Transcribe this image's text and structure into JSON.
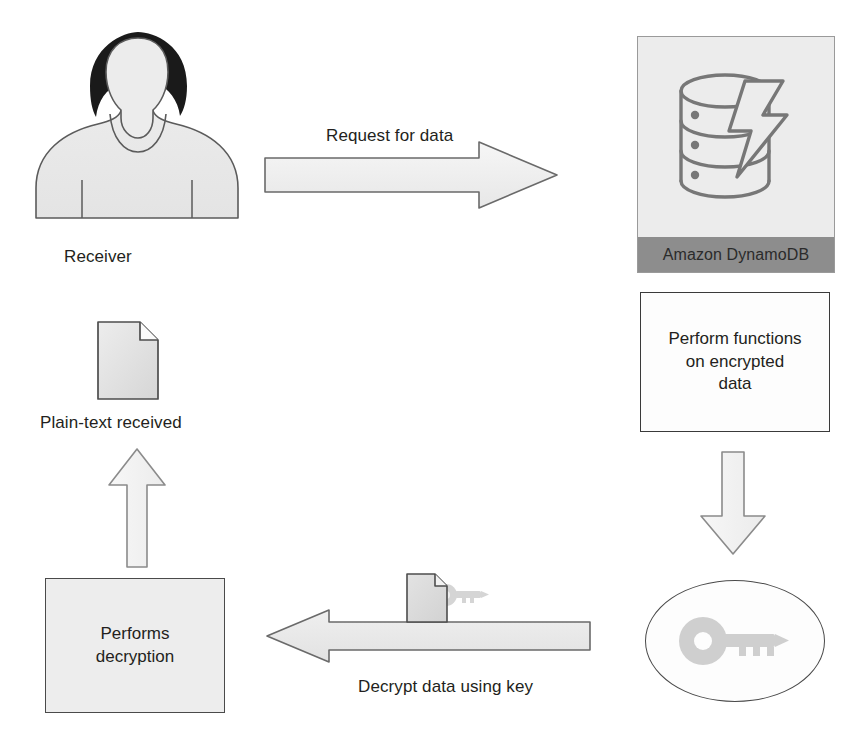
{
  "diagram": {
    "background_color": "#ffffff",
    "nodes": {
      "receiver": {
        "label": "Receiver",
        "icon": "person-silhouette-icon"
      },
      "dynamodb": {
        "label": "Amazon DynamoDB",
        "icon": "database-lightning-icon",
        "panel_color": "#ececec",
        "footer_color": "#8d8d8d"
      },
      "perform_functions": {
        "label": "Perform functions\non encrypted\ndata",
        "fill": "#fdfdfd"
      },
      "key_store": {
        "icon": "key-icon",
        "fill": "#fdfdfd"
      },
      "performs_decryption": {
        "label": "Performs\ndecryption",
        "fill": "#ededed"
      },
      "plain_text": {
        "label": "Plain-text received",
        "icon": "document-icon"
      },
      "encrypted_doc": {
        "icon": "document-with-key-icon"
      }
    },
    "arrows": {
      "request": {
        "label": "Request for data",
        "direction": "right",
        "fill": "#efefef"
      },
      "to_key": {
        "label": "",
        "direction": "down",
        "fill": "#f4f4f4"
      },
      "decrypt": {
        "label": "Decrypt data using key",
        "direction": "left",
        "fill": "#e8e8e8"
      },
      "to_plaintext": {
        "label": "",
        "direction": "up",
        "fill": "#f4f4f4"
      }
    },
    "caption": ""
  }
}
